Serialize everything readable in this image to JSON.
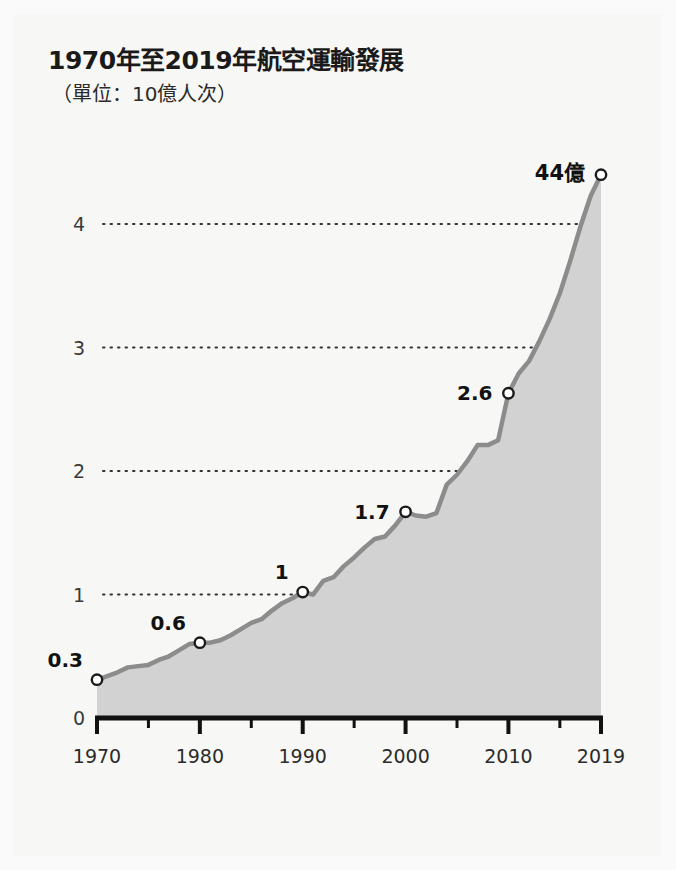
{
  "header": {
    "title": "1970年至2019年航空運輸發展",
    "subtitle": "（單位：10億人次）"
  },
  "chart_data": {
    "type": "area",
    "title": "1970年至2019年航空運輸發展",
    "subtitle": "（單位：10億人次）",
    "xlabel": "",
    "ylabel": "",
    "unit_note": "（單位：10億人次）",
    "xlim": [
      1970,
      2019
    ],
    "ylim": [
      0,
      4.6
    ],
    "yticks": [
      "0",
      "1",
      "2",
      "3",
      "4"
    ],
    "ytick_values": [
      0,
      1,
      2,
      3,
      4
    ],
    "xticks": [
      "1970",
      "1980",
      "1990",
      "2000",
      "2010",
      "2019"
    ],
    "xtick_values": [
      1970,
      1980,
      1990,
      2000,
      2010,
      2019
    ],
    "minor_xticks": [
      1975,
      1985,
      1995,
      2005,
      2015
    ],
    "grid": "horizontal-dotted",
    "legend": "none",
    "series_name": "全球航空旅客人次",
    "x": [
      1970,
      1971,
      1972,
      1973,
      1974,
      1975,
      1976,
      1977,
      1978,
      1979,
      1980,
      1981,
      1982,
      1983,
      1984,
      1985,
      1986,
      1987,
      1988,
      1989,
      1990,
      1991,
      1992,
      1993,
      1994,
      1995,
      1996,
      1997,
      1998,
      1999,
      2000,
      2001,
      2002,
      2003,
      2004,
      2005,
      2006,
      2007,
      2008,
      2009,
      2010,
      2011,
      2012,
      2013,
      2014,
      2015,
      2016,
      2017,
      2018,
      2019
    ],
    "values": [
      0.31,
      0.34,
      0.37,
      0.41,
      0.42,
      0.43,
      0.47,
      0.5,
      0.55,
      0.6,
      0.61,
      0.61,
      0.63,
      0.67,
      0.72,
      0.77,
      0.8,
      0.87,
      0.93,
      0.97,
      1.02,
      1.0,
      1.11,
      1.14,
      1.23,
      1.3,
      1.38,
      1.45,
      1.47,
      1.56,
      1.67,
      1.64,
      1.63,
      1.66,
      1.89,
      1.97,
      2.08,
      2.21,
      2.21,
      2.25,
      2.63,
      2.79,
      2.89,
      3.05,
      3.23,
      3.44,
      3.7,
      3.98,
      4.23,
      4.4
    ],
    "point_labels": [
      {
        "x": 1970,
        "y": 0.31,
        "label": "0.3"
      },
      {
        "x": 1980,
        "y": 0.61,
        "label": "0.6"
      },
      {
        "x": 1990,
        "y": 1.02,
        "label": "1"
      },
      {
        "x": 2000,
        "y": 1.67,
        "label": "1.7"
      },
      {
        "x": 2010,
        "y": 2.63,
        "label": "2.6"
      },
      {
        "x": 2019,
        "y": 4.4,
        "label": "44億"
      }
    ],
    "colors": {
      "area_fill": "#d2d2d2",
      "line": "#8c8c8c",
      "marker_fill": "#ffffff",
      "marker_stroke": "#1a1a1a",
      "axis": "#111111",
      "grid_dot": "#333333",
      "text": "#1a1a1a",
      "background": "#f7f7f5"
    }
  }
}
